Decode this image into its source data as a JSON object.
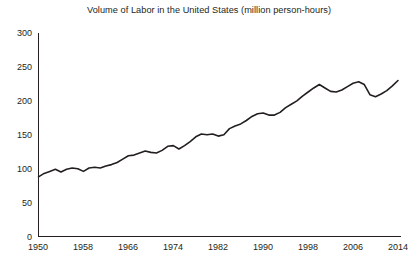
{
  "chart_data": {
    "type": "line",
    "title": "Volume of Labor in the United States (million person-hours)",
    "xlabel": "",
    "ylabel": "",
    "xlim": [
      1950,
      2014
    ],
    "ylim": [
      0,
      300
    ],
    "grid": false,
    "legend": null,
    "y_ticks": [
      0,
      50,
      100,
      150,
      200,
      250,
      300
    ],
    "x_ticks": [
      1950,
      1958,
      1966,
      1974,
      1982,
      1990,
      1998,
      2006,
      2014
    ],
    "series": [
      {
        "name": "Volume of Labor",
        "color": "#231f20",
        "x": [
          1950,
          1951,
          1952,
          1953,
          1954,
          1955,
          1956,
          1957,
          1958,
          1959,
          1960,
          1961,
          1962,
          1963,
          1964,
          1965,
          1966,
          1967,
          1968,
          1969,
          1970,
          1971,
          1972,
          1973,
          1974,
          1975,
          1976,
          1977,
          1978,
          1979,
          1980,
          1981,
          1982,
          1983,
          1984,
          1985,
          1986,
          1987,
          1988,
          1989,
          1990,
          1991,
          1992,
          1993,
          1994,
          1995,
          1996,
          1997,
          1998,
          1999,
          2000,
          2001,
          2002,
          2003,
          2004,
          2005,
          2006,
          2007,
          2008,
          2009,
          2010,
          2011,
          2012,
          2013,
          2014
        ],
        "values": [
          88,
          93,
          96,
          99,
          95,
          99,
          101,
          100,
          96,
          101,
          102,
          101,
          104,
          106,
          109,
          114,
          119,
          120,
          123,
          126,
          124,
          123,
          127,
          133,
          134,
          129,
          134,
          140,
          147,
          151,
          150,
          151,
          148,
          150,
          159,
          163,
          166,
          171,
          177,
          181,
          182,
          179,
          179,
          183,
          190,
          195,
          200,
          207,
          213,
          219,
          224,
          219,
          214,
          213,
          216,
          221,
          226,
          228,
          224,
          209,
          206,
          210,
          215,
          222,
          230
        ]
      }
    ]
  },
  "axis": {
    "y_tick_labels": [
      "300",
      "250",
      "200",
      "150",
      "100",
      "50",
      "0"
    ],
    "x_tick_labels": [
      "1950",
      "1958",
      "1966",
      "1974",
      "1982",
      "1990",
      "1998",
      "2006",
      "2014"
    ]
  }
}
